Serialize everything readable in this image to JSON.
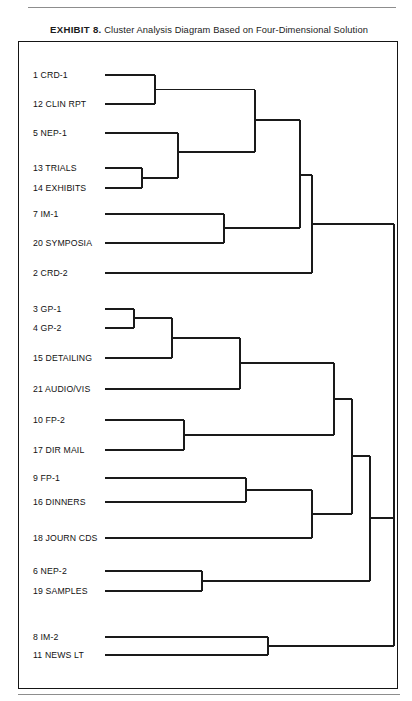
{
  "caption": {
    "exhibit_label": "EXHIBIT 8.",
    "text": "Cluster Analysis Diagram Based on Four-Dimensional Solution"
  },
  "colors": {
    "line": "#1a1a1a",
    "frame": "#151515",
    "rule": "#8d8d8d",
    "text": "#111111",
    "background": "#ffffff"
  },
  "chart_data": {
    "type": "dendrogram",
    "title": "Cluster Analysis Diagram Based on Four-Dimensional Solution",
    "orientation": "horizontal-left-to-right",
    "xlabel": "",
    "ylabel": "",
    "grid": false,
    "legend": "none",
    "leaf_count": 21,
    "leaf_x_start": 105,
    "root_x": 394,
    "leaves": [
      {
        "id": 1,
        "label": "1 CRD-1",
        "y": 75,
        "label_x": 33
      },
      {
        "id": 12,
        "label": "12 CLIN RPT",
        "y": 104,
        "label_x": 33
      },
      {
        "id": 5,
        "label": "5 NEP-1",
        "y": 133,
        "label_x": 33
      },
      {
        "id": 13,
        "label": "13 TRIALS",
        "y": 168,
        "label_x": 33
      },
      {
        "id": 14,
        "label": "14 EXHIBITS",
        "y": 188,
        "label_x": 33
      },
      {
        "id": 7,
        "label": "7 IM-1",
        "y": 214,
        "label_x": 33
      },
      {
        "id": 20,
        "label": "20 SYMPOSIA",
        "y": 243,
        "label_x": 33
      },
      {
        "id": 2,
        "label": "2 CRD-2",
        "y": 273,
        "label_x": 33
      },
      {
        "id": 3,
        "label": "3 GP-1",
        "y": 309,
        "label_x": 33
      },
      {
        "id": 4,
        "label": "4 GP-2",
        "y": 328,
        "label_x": 33
      },
      {
        "id": 15,
        "label": "15 DETAILING",
        "y": 358,
        "label_x": 33
      },
      {
        "id": 21,
        "label": "21 AUDIO/VIS",
        "y": 389,
        "label_x": 33
      },
      {
        "id": 10,
        "label": "10 FP-2",
        "y": 420,
        "label_x": 33
      },
      {
        "id": 17,
        "label": "17 DIR MAIL",
        "y": 450,
        "label_x": 33
      },
      {
        "id": 9,
        "label": "9 FP-1",
        "y": 478,
        "label_x": 33
      },
      {
        "id": 16,
        "label": "16 DINNERS",
        "y": 502,
        "label_x": 33
      },
      {
        "id": 18,
        "label": "18 JOURN CDS",
        "y": 538,
        "label_x": 33
      },
      {
        "id": 6,
        "label": "6 NEP-2",
        "y": 571,
        "label_x": 33
      },
      {
        "id": 19,
        "label": "19 SAMPLES",
        "y": 591,
        "label_x": 33
      },
      {
        "id": 8,
        "label": "8 IM-2",
        "y": 637,
        "label_x": 33
      },
      {
        "id": 11,
        "label": "11 NEWS LT",
        "y": 655,
        "label_x": 33
      }
    ],
    "merges": [
      {
        "name": "m-1-12",
        "x": 155,
        "y_top": 75,
        "y_bottom": 104,
        "y_out": 89.5
      },
      {
        "name": "m-13-14",
        "x": 142,
        "y_top": 168,
        "y_bottom": 188,
        "y_out": 178
      },
      {
        "name": "m-5-1314",
        "x": 178,
        "y_top": 133,
        "y_bottom": 178,
        "y_out": 152
      },
      {
        "name": "m-112-51314",
        "x": 255,
        "y_top": 89.5,
        "y_bottom": 152,
        "y_out": 120
      },
      {
        "name": "m-7-20",
        "x": 224,
        "y_top": 214,
        "y_bottom": 243,
        "y_out": 228
      },
      {
        "name": "m-upper-720",
        "x": 300,
        "y_top": 120,
        "y_bottom": 228,
        "y_out": 175
      },
      {
        "name": "m-upper-2",
        "x": 312,
        "y_top": 175,
        "y_bottom": 273,
        "y_out": 224
      },
      {
        "name": "m-3-4",
        "x": 134,
        "y_top": 309,
        "y_bottom": 328,
        "y_out": 318
      },
      {
        "name": "m-34-15",
        "x": 172,
        "y_top": 318,
        "y_bottom": 358,
        "y_out": 338
      },
      {
        "name": "m-3415-21",
        "x": 240,
        "y_top": 338,
        "y_bottom": 389,
        "y_out": 363
      },
      {
        "name": "m-10-17",
        "x": 184,
        "y_top": 420,
        "y_bottom": 450,
        "y_out": 435
      },
      {
        "name": "m-gp-fp2",
        "x": 334,
        "y_top": 363,
        "y_bottom": 435,
        "y_out": 399
      },
      {
        "name": "m-9-16",
        "x": 246,
        "y_top": 478,
        "y_bottom": 502,
        "y_out": 490
      },
      {
        "name": "m-916-18",
        "x": 312,
        "y_top": 490,
        "y_bottom": 538,
        "y_out": 514
      },
      {
        "name": "m-mid-lower",
        "x": 352,
        "y_top": 399,
        "y_bottom": 514,
        "y_out": 456
      },
      {
        "name": "m-6-19",
        "x": 202,
        "y_top": 571,
        "y_bottom": 591,
        "y_out": 581
      },
      {
        "name": "m-midblock-619",
        "x": 370,
        "y_top": 456,
        "y_bottom": 581,
        "y_out": 518
      },
      {
        "name": "m-8-11",
        "x": 268,
        "y_top": 637,
        "y_bottom": 655,
        "y_out": 646
      },
      {
        "name": "m-root",
        "x": 394,
        "y_top": 224,
        "y_bottom": 518,
        "y_out": 371
      },
      {
        "name": "m-root-final",
        "x": 394,
        "y_top": 371,
        "y_bottom": 646,
        "y_out": 508
      }
    ]
  }
}
